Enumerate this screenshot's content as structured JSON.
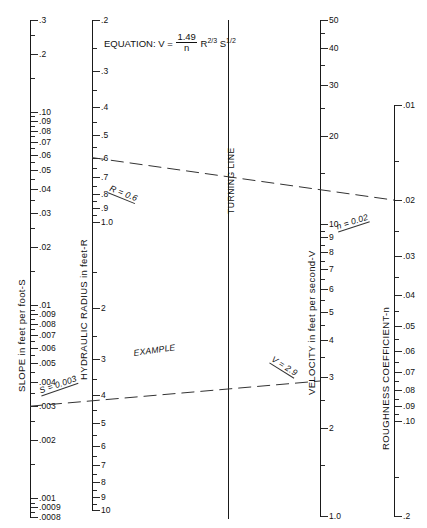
{
  "figure": {
    "type": "nomograph",
    "equation_text": "EQUATION:",
    "equation_var": "V =",
    "equation_num": "1.49",
    "equation_den": "n",
    "equation_tail_r": "R",
    "equation_tail_r_exp": "2/3",
    "equation_tail_s": "S",
    "equation_tail_s_exp": "1/2",
    "turning_line_label": "TURNING LINE",
    "example_label": "EXAMPLE"
  },
  "axes": {
    "slope": {
      "title": "SLOPE in feet per foot-S",
      "x": 30,
      "top": 20,
      "bottom": 517,
      "scale": "log-descending",
      "range": [
        0.3,
        0.0008
      ],
      "labels": [
        "0.3",
        "0.2",
        "0.10",
        "0.09",
        "0.08",
        "0.07",
        "0.06",
        "0.05",
        "0.04",
        "0.03",
        "0.02",
        "0.01",
        "0.009",
        "0.008",
        "0.007",
        "0.006",
        "0.005",
        "0.004",
        "0.003",
        "0.002",
        "0.001",
        "0.0009",
        "0.0008"
      ],
      "label_texts": [
        ".3",
        ".2",
        ".10",
        ".09",
        ".08",
        ".07",
        ".06",
        ".05",
        ".04",
        ".03",
        ".02",
        ".01",
        ".009",
        ".008",
        ".007",
        ".006",
        ".005",
        ".004",
        ".003",
        ".002",
        ".001",
        ".0009",
        ".0008"
      ]
    },
    "hydraulic_radius": {
      "title": "HYDRAULIC RADIUS in feet-R",
      "x": 92,
      "top": 20,
      "bottom": 510,
      "scale": "log-descending",
      "range": [
        0.2,
        10
      ],
      "label_texts": [
        ".2",
        ".3",
        ".4",
        ".5",
        ".6",
        ".7",
        ".8",
        ".9",
        "1.0",
        "2",
        "3",
        "4",
        "5",
        "6",
        "7",
        "8",
        "9",
        "10"
      ],
      "label_values": [
        0.2,
        0.3,
        0.4,
        0.5,
        0.6,
        0.7,
        0.8,
        0.9,
        1.0,
        2,
        3,
        4,
        5,
        6,
        7,
        8,
        9,
        10
      ]
    },
    "turning_line": {
      "x": 228,
      "top": 20,
      "bottom": 519
    },
    "velocity": {
      "title": "VELOCITY in feet per second-V",
      "x": 320,
      "top": 20,
      "bottom": 516,
      "scale": "log-descending",
      "range": [
        50,
        1.0
      ],
      "label_texts": [
        "50",
        "40",
        "30",
        "20",
        "10",
        "9",
        "8",
        "7",
        "6",
        "5",
        "4",
        "3",
        "2",
        "1.0"
      ],
      "label_values": [
        50,
        40,
        30,
        20,
        10,
        9,
        8,
        7,
        6,
        5,
        4,
        3,
        2,
        1.0
      ]
    },
    "roughness": {
      "title": "ROUGHNESS COEFFICIENT-n",
      "x": 394,
      "top": 105,
      "bottom": 516,
      "scale": "log-descending",
      "range": [
        0.01,
        0.2
      ],
      "label_texts": [
        ".01",
        ".02",
        ".03",
        ".04",
        ".05",
        ".06",
        ".07",
        ".08",
        ".09",
        ".10",
        ".2"
      ],
      "label_values": [
        0.01,
        0.02,
        0.03,
        0.04,
        0.05,
        0.06,
        0.07,
        0.08,
        0.09,
        0.1,
        0.2
      ]
    }
  },
  "example": {
    "slope_label": "S = 0.003",
    "radius_label": "R = 0.6",
    "velocity_label": "V = 2.9",
    "roughness_label": "n = 0.02",
    "example_label": "EXAMPLE",
    "slope_value": 0.003,
    "radius_value": 0.6,
    "velocity_value": 2.9,
    "roughness_value": 0.02
  },
  "chart_data": {
    "type": "line",
    "series": [
      {
        "name": "upper-example-ray",
        "points": [
          [
            92,
            175
          ],
          [
            228,
            297
          ],
          [
            394,
            213
          ]
        ],
        "dashed": true,
        "endpoints": [
          "R = 0.6 on hydraulic-radius axis",
          "turning line",
          "n = 0.02 on roughness axis"
        ]
      },
      {
        "name": "lower-example-ray",
        "points": [
          [
            30,
            384
          ],
          [
            228,
            297
          ],
          [
            320,
            350
          ]
        ],
        "dashed": true,
        "endpoints": [
          "S = 0.003 on slope axis",
          "turning line",
          "V = 2.9 on velocity axis"
        ]
      }
    ],
    "xlabel": "",
    "ylabel": "",
    "grid": false,
    "legend": "none"
  },
  "colors": {
    "ink": "#111111",
    "line": "#1a1a1a",
    "background": "#ffffff"
  }
}
